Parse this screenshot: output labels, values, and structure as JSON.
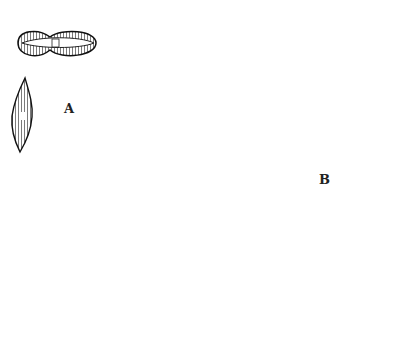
{
  "figure": {
    "panels": [
      {
        "label": "A",
        "description": "pennate diatoms (naviculoid forms)"
      },
      {
        "label": "B",
        "description": "centric diatoms (triangular and biddulphioid forms)"
      }
    ]
  },
  "colors": {
    "ink": "#1a1a1a",
    "stipple": "#e8e8e8",
    "background": "#ffffff"
  }
}
